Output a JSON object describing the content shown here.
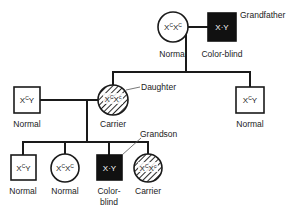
{
  "diagram": {
    "type": "pedigree",
    "generations": [
      {
        "id": "gen1",
        "members": [
          {
            "role": "grandmother",
            "sex": "female",
            "genotype_base": "X",
            "genotype_sup1": "C",
            "genotype_sup2": "C",
            "genotype": "XCXC",
            "phenotype": "Normal",
            "affected": false,
            "carrier": false
          },
          {
            "role": "grandfather",
            "sex": "male",
            "genotype": "XcY",
            "genotype_display": "X·Y",
            "phenotype": "Color-blind",
            "affected": true,
            "carrier": false,
            "callout": "Grandfather"
          }
        ]
      },
      {
        "id": "gen2",
        "members": [
          {
            "role": "daughter-husband",
            "sex": "male",
            "genotype": "XCY",
            "phenotype": "Normal",
            "affected": false
          },
          {
            "role": "daughter",
            "sex": "female",
            "genotype": "XCXc",
            "phenotype": "Carrier",
            "affected": false,
            "carrier": true,
            "callout": "Daughter"
          },
          {
            "role": "son",
            "sex": "male",
            "genotype": "XCY",
            "phenotype": "Normal",
            "affected": false
          }
        ]
      },
      {
        "id": "gen3",
        "members": [
          {
            "role": "grandchild-1",
            "sex": "male",
            "genotype": "XCY",
            "phenotype": "Normal",
            "affected": false
          },
          {
            "role": "grandchild-2",
            "sex": "female",
            "genotype": "XCXC",
            "phenotype": "Normal",
            "affected": false
          },
          {
            "role": "grandson",
            "sex": "male",
            "genotype": "XcY",
            "genotype_display": "X·Y",
            "phenotype_line1": "Color-",
            "phenotype_line2": "blind",
            "phenotype": "Color-blind",
            "affected": true,
            "callout": "Grandson"
          },
          {
            "role": "grandchild-4",
            "sex": "female",
            "genotype": "XCXc",
            "phenotype": "Carrier",
            "carrier": true
          }
        ]
      }
    ],
    "labels": {
      "grandmother_phenotype": "Normal",
      "grandfather_phenotype": "Color-blind",
      "grandfather_callout": "Grandfather",
      "husband_phenotype": "Normal",
      "daughter_phenotype": "Carrier",
      "daughter_callout": "Daughter",
      "son_phenotype": "Normal",
      "grandson_callout": "Grandson",
      "gc1_phenotype": "Normal",
      "gc2_phenotype": "Normal",
      "gc3_phenotype_line1": "Color-",
      "gc3_phenotype_line2": "blind",
      "gc4_phenotype": "Carrier"
    },
    "genotypes": {
      "X": "X",
      "Y": "Y",
      "C": "C",
      "c": "c",
      "dot_Y": "·Y"
    },
    "colors": {
      "ink": "#1a1a1a",
      "affected_fill": "#111111",
      "background": "#ffffff"
    }
  }
}
